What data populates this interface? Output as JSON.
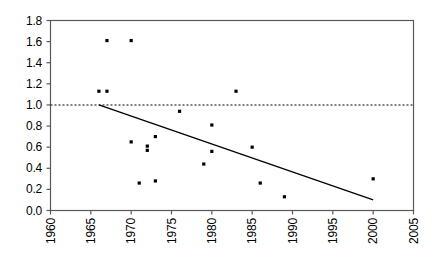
{
  "chart_data": {
    "type": "scatter",
    "title": "",
    "xlabel": "",
    "ylabel": "",
    "xlim": [
      1960,
      2005
    ],
    "ylim": [
      0.0,
      1.8
    ],
    "xticks": [
      1960,
      1965,
      1970,
      1975,
      1980,
      1985,
      1990,
      1995,
      2000,
      2005
    ],
    "xtick_labels": [
      "1960",
      "1965",
      "1970",
      "1975",
      "1980",
      "1985",
      "1990",
      "1995",
      "2000",
      "2005"
    ],
    "yticks": [
      0.0,
      0.2,
      0.4,
      0.6,
      0.8,
      1.0,
      1.2,
      1.4,
      1.6,
      1.8
    ],
    "ytick_labels": [
      "0.0",
      "0.2",
      "0.4",
      "0.6",
      "0.8",
      "1.0",
      "1.2",
      "1.4",
      "1.6",
      "1.8"
    ],
    "grid": false,
    "legend": null,
    "xtick_rotation": 90,
    "series": [
      {
        "name": "observations",
        "type": "scatter",
        "marker": "square",
        "color": "#000000",
        "points": [
          {
            "x": 1966,
            "y": 1.13
          },
          {
            "x": 1967,
            "y": 1.13
          },
          {
            "x": 1967,
            "y": 1.61
          },
          {
            "x": 1970,
            "y": 1.61
          },
          {
            "x": 1970,
            "y": 0.65
          },
          {
            "x": 1971,
            "y": 0.26
          },
          {
            "x": 1972,
            "y": 0.61
          },
          {
            "x": 1972,
            "y": 0.57
          },
          {
            "x": 1973,
            "y": 0.7
          },
          {
            "x": 1973,
            "y": 0.28
          },
          {
            "x": 1976,
            "y": 0.94
          },
          {
            "x": 1979,
            "y": 0.44
          },
          {
            "x": 1980,
            "y": 0.81
          },
          {
            "x": 1980,
            "y": 0.56
          },
          {
            "x": 1983,
            "y": 1.13
          },
          {
            "x": 1985,
            "y": 0.6
          },
          {
            "x": 1986,
            "y": 0.26
          },
          {
            "x": 1989,
            "y": 0.13
          },
          {
            "x": 2000,
            "y": 0.3
          }
        ]
      },
      {
        "name": "trend-line",
        "type": "line",
        "style": "solid",
        "color": "#000000",
        "points": [
          {
            "x": 1966,
            "y": 1.0
          },
          {
            "x": 2000,
            "y": 0.1
          }
        ]
      },
      {
        "name": "reference-line",
        "type": "line",
        "style": "dotted",
        "color": "#000000",
        "points": [
          {
            "x": 1960,
            "y": 1.0
          },
          {
            "x": 2005,
            "y": 1.0
          }
        ]
      }
    ]
  }
}
